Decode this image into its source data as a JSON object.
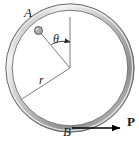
{
  "figure": {
    "background_color": "#ffffff",
    "ring": {
      "name": "circular-ring",
      "center_x": 70,
      "center_y": 68,
      "outer_radius": 64,
      "inner_radius": 58,
      "tube_fill_color": "#b9b9b9",
      "tube_highlight_color": "#efefef",
      "tube_stroke_color": "#555555"
    },
    "bead": {
      "name": "bead",
      "x": 38,
      "y": 30,
      "radius": 4,
      "fill_color": "#a9a9a9",
      "stroke_color": "#4a4a4a"
    },
    "lines": [
      {
        "name": "vertical-reference-line",
        "x1": 70,
        "y1": 18,
        "x2": 70,
        "y2": 68
      },
      {
        "name": "radius-to-bead-line",
        "x1": 70,
        "y1": 68,
        "x2": 38,
        "y2": 30
      },
      {
        "name": "radius-line-r",
        "x1": 70,
        "y1": 68,
        "x2": 22,
        "y2": 99
      }
    ],
    "angle_arc": {
      "name": "theta-arc",
      "radius": 26,
      "start_angle_deg": 90,
      "end_angle_deg": 130
    },
    "force_arrow": {
      "name": "force-arrow-P",
      "x1": 72,
      "y1": 128,
      "x2": 125,
      "y2": 128,
      "color": "#000000"
    },
    "labels": {
      "point_a": "A",
      "point_b": "B",
      "radius": "r",
      "angle": "θ",
      "force": "P"
    },
    "stroke_color": "#4a4a4a"
  }
}
